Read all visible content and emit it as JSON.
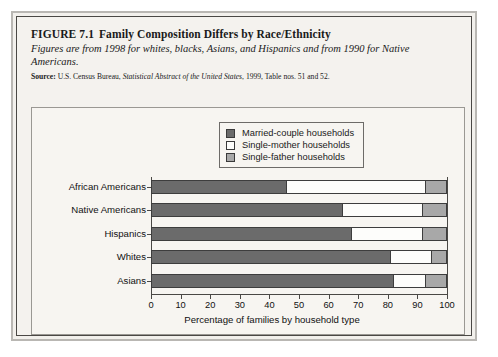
{
  "figure": {
    "number": "FIGURE 7.1",
    "title": "Family Composition Differs by Race/Ethnicity",
    "subtitle": "Figures are from 1998 for whites, blacks, Asians, and Hispanics and from 1990 for Native Americans.",
    "source_label": "Source:",
    "source_text_1": "U.S. Census Bureau, ",
    "source_italic": "Statistical Abstract of the United States",
    "source_text_2": ", 1999, Table nos. 51 and 52."
  },
  "chart_data": {
    "type": "bar",
    "orientation": "horizontal",
    "stacked": true,
    "title": "Family Composition Differs by Race/Ethnicity",
    "xlabel": "Percentage of families by household type",
    "ylabel": "",
    "xlim": [
      0,
      100
    ],
    "xticks": [
      0,
      10,
      20,
      30,
      40,
      50,
      60,
      70,
      80,
      90,
      100
    ],
    "grid": false,
    "legend_position": "top-center",
    "categories": [
      "African Americans",
      "Native Americans",
      "Hispanics",
      "Whites",
      "Asians"
    ],
    "series": [
      {
        "name": "Married-couple households",
        "color": "#6b6b6b",
        "values": [
          46,
          65,
          68,
          81,
          82
        ]
      },
      {
        "name": "Single-mother households",
        "color": "#fdfdfb",
        "values": [
          47,
          27,
          24,
          14,
          11
        ]
      },
      {
        "name": "Single-father households",
        "color": "#a8a8a8",
        "values": [
          7,
          8,
          8,
          5,
          7
        ]
      }
    ]
  },
  "colors": {
    "married": "#6b6b6b",
    "single_mother": "#fdfdfb",
    "single_father": "#a8a8a8",
    "panel_bg": "#f7f5f1",
    "page_bg": "#f2f0ec",
    "frame": "#4a4845"
  }
}
